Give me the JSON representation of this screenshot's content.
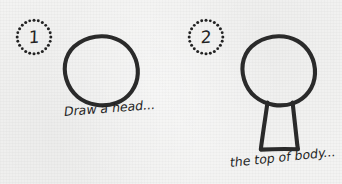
{
  "sheet": {
    "background_color": "#f3f3f2",
    "ink_color": "#2a2a2a",
    "width": 342,
    "height": 184
  },
  "steps": [
    {
      "badge_number": "1",
      "badge_icon": "dotted-circle-badge-icon",
      "drawing_icon": "hand-drawn-circle-head-icon",
      "caption": "Draw a head..."
    },
    {
      "badge_number": "2",
      "badge_icon": "dotted-circle-badge-icon",
      "drawing_icon": "hand-drawn-head-and-trapezoid-body-icon",
      "caption": "the top of body..."
    }
  ]
}
